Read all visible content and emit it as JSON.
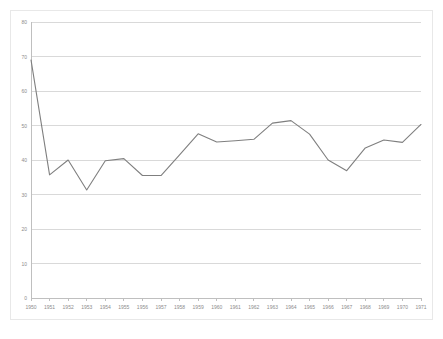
{
  "chart_data": {
    "type": "line",
    "title": "",
    "subtitle": "",
    "xlabel": "",
    "ylabel": "",
    "grid": true,
    "legend": false,
    "legend_position": "none",
    "series_color": "#7f7f7f",
    "gridline_color": "#d9d9d9",
    "axis_color": "#bfbfbf",
    "background_color": "#ffffff",
    "tick_label_color": "#8c8c8c",
    "xlim": [
      1950,
      1971
    ],
    "ylim": [
      0,
      80
    ],
    "y_tick_labels": [
      "0",
      "10",
      "20",
      "30",
      "40",
      "50",
      "60",
      "70",
      "80"
    ],
    "y_ticks": [
      0,
      10,
      20,
      30,
      40,
      50,
      60,
      70,
      80
    ],
    "categories": [
      "1950",
      "1951",
      "1952",
      "1953",
      "1954",
      "1955",
      "1956",
      "1957",
      "1958",
      "1959",
      "1960",
      "1961",
      "1962",
      "1963",
      "1964",
      "1965",
      "1966",
      "1967",
      "1968",
      "1969",
      "1970",
      "1971"
    ],
    "x": [
      1950,
      1951,
      1952,
      1953,
      1954,
      1955,
      1956,
      1957,
      1958,
      1959,
      1960,
      1961,
      1962,
      1963,
      1964,
      1965,
      1966,
      1967,
      1968,
      1969,
      1970,
      1971
    ],
    "values": [
      69.0,
      35.7,
      40.0,
      31.3,
      39.8,
      40.4,
      35.5,
      35.5,
      41.5,
      47.6,
      45.2,
      45.6,
      46.0,
      50.7,
      51.4,
      47.5,
      40.0,
      36.9,
      43.5,
      45.8,
      45.1,
      50.3
    ],
    "series": [
      {
        "name": "",
        "color": "#7f7f7f",
        "values": [
          69.0,
          35.7,
          40.0,
          31.3,
          39.8,
          40.4,
          35.5,
          35.5,
          41.5,
          47.6,
          45.2,
          45.6,
          46.0,
          50.7,
          51.4,
          47.5,
          40.0,
          36.9,
          43.5,
          45.8,
          45.1,
          50.3
        ]
      }
    ],
    "annotations": []
  }
}
